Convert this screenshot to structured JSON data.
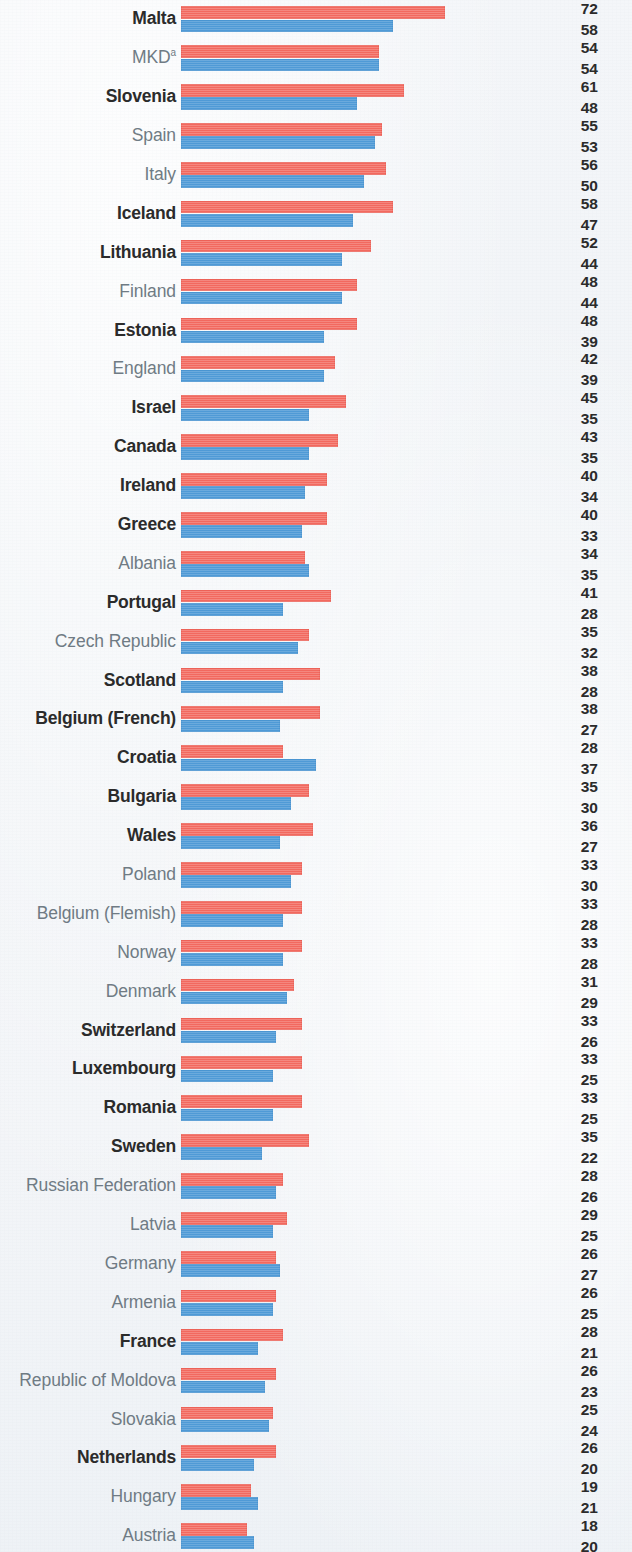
{
  "chart_data": {
    "type": "bar",
    "orientation": "horizontal",
    "title": "",
    "subtitle": "",
    "xlabel": "",
    "ylabel": "",
    "grid": false,
    "legend_position": "none",
    "xlim": [
      0,
      72
    ],
    "value_axis_max": 72,
    "colors": {
      "series_red": "#f2695f",
      "series_blue": "#4f9ad6",
      "background": "#f2f5f8",
      "label_regular": "#6f7b84",
      "label_bold": "#2b2b2b",
      "value_text": "#2b2b2b"
    },
    "series": [
      {
        "name": "red",
        "color": "#f2695f",
        "position": "top"
      },
      {
        "name": "blue",
        "color": "#4f9ad6",
        "position": "bottom"
      }
    ],
    "categories": [
      "Malta",
      "MKD",
      "Slovenia",
      "Spain",
      "Italy",
      "Iceland",
      "Lithuania",
      "Finland",
      "Estonia",
      "England",
      "Israel",
      "Canada",
      "Ireland",
      "Greece",
      "Albania",
      "Portugal",
      "Czech Republic",
      "Scotland",
      "Belgium (French)",
      "Croatia",
      "Bulgaria",
      "Wales",
      "Poland",
      "Belgium (Flemish)",
      "Norway",
      "Denmark",
      "Switzerland",
      "Luxembourg",
      "Romania",
      "Sweden",
      "Russian Federation",
      "Latvia",
      "Germany",
      "Armenia",
      "France",
      "Republic of Moldova",
      "Slovakia",
      "Netherlands",
      "Hungary",
      "Austria",
      "Ukraine"
    ],
    "values_red": [
      72,
      54,
      61,
      55,
      56,
      58,
      52,
      48,
      48,
      42,
      45,
      43,
      40,
      40,
      34,
      41,
      35,
      38,
      38,
      28,
      35,
      36,
      33,
      33,
      33,
      31,
      33,
      33,
      33,
      35,
      28,
      29,
      26,
      26,
      28,
      26,
      25,
      26,
      19,
      18,
      16
    ],
    "values_blue": [
      58,
      54,
      48,
      53,
      50,
      47,
      44,
      44,
      39,
      39,
      35,
      35,
      34,
      33,
      35,
      28,
      32,
      28,
      27,
      37,
      30,
      27,
      30,
      28,
      28,
      29,
      26,
      25,
      25,
      22,
      26,
      25,
      27,
      25,
      21,
      23,
      24,
      20,
      21,
      20,
      17
    ]
  },
  "rows": [
    {
      "label": "Malta",
      "superscript": "",
      "bold": true,
      "red": 72,
      "blue": 58
    },
    {
      "label": "MKD",
      "superscript": "a",
      "bold": false,
      "red": 54,
      "blue": 54
    },
    {
      "label": "Slovenia",
      "superscript": "",
      "bold": true,
      "red": 61,
      "blue": 48
    },
    {
      "label": "Spain",
      "superscript": "",
      "bold": false,
      "red": 55,
      "blue": 53
    },
    {
      "label": "Italy",
      "superscript": "",
      "bold": false,
      "red": 56,
      "blue": 50
    },
    {
      "label": "Iceland",
      "superscript": "",
      "bold": true,
      "red": 58,
      "blue": 47
    },
    {
      "label": "Lithuania",
      "superscript": "",
      "bold": true,
      "red": 52,
      "blue": 44
    },
    {
      "label": "Finland",
      "superscript": "",
      "bold": false,
      "red": 48,
      "blue": 44
    },
    {
      "label": "Estonia",
      "superscript": "",
      "bold": true,
      "red": 48,
      "blue": 39
    },
    {
      "label": "England",
      "superscript": "",
      "bold": false,
      "red": 42,
      "blue": 39
    },
    {
      "label": "Israel",
      "superscript": "",
      "bold": true,
      "red": 45,
      "blue": 35
    },
    {
      "label": "Canada",
      "superscript": "",
      "bold": true,
      "red": 43,
      "blue": 35
    },
    {
      "label": "Ireland",
      "superscript": "",
      "bold": true,
      "red": 40,
      "blue": 34
    },
    {
      "label": "Greece",
      "superscript": "",
      "bold": true,
      "red": 40,
      "blue": 33
    },
    {
      "label": "Albania",
      "superscript": "",
      "bold": false,
      "red": 34,
      "blue": 35
    },
    {
      "label": "Portugal",
      "superscript": "",
      "bold": true,
      "red": 41,
      "blue": 28
    },
    {
      "label": "Czech Republic",
      "superscript": "",
      "bold": false,
      "red": 35,
      "blue": 32
    },
    {
      "label": "Scotland",
      "superscript": "",
      "bold": true,
      "red": 38,
      "blue": 28
    },
    {
      "label": "Belgium (French)",
      "superscript": "",
      "bold": true,
      "red": 38,
      "blue": 27
    },
    {
      "label": "Croatia",
      "superscript": "",
      "bold": true,
      "red": 28,
      "blue": 37
    },
    {
      "label": "Bulgaria",
      "superscript": "",
      "bold": true,
      "red": 35,
      "blue": 30
    },
    {
      "label": "Wales",
      "superscript": "",
      "bold": true,
      "red": 36,
      "blue": 27
    },
    {
      "label": "Poland",
      "superscript": "",
      "bold": false,
      "red": 33,
      "blue": 30
    },
    {
      "label": "Belgium (Flemish)",
      "superscript": "",
      "bold": false,
      "red": 33,
      "blue": 28
    },
    {
      "label": "Norway",
      "superscript": "",
      "bold": false,
      "red": 33,
      "blue": 28
    },
    {
      "label": "Denmark",
      "superscript": "",
      "bold": false,
      "red": 31,
      "blue": 29
    },
    {
      "label": "Switzerland",
      "superscript": "",
      "bold": true,
      "red": 33,
      "blue": 26
    },
    {
      "label": "Luxembourg",
      "superscript": "",
      "bold": true,
      "red": 33,
      "blue": 25
    },
    {
      "label": "Romania",
      "superscript": "",
      "bold": true,
      "red": 33,
      "blue": 25
    },
    {
      "label": "Sweden",
      "superscript": "",
      "bold": true,
      "red": 35,
      "blue": 22
    },
    {
      "label": "Russian Federation",
      "superscript": "",
      "bold": false,
      "red": 28,
      "blue": 26
    },
    {
      "label": "Latvia",
      "superscript": "",
      "bold": false,
      "red": 29,
      "blue": 25
    },
    {
      "label": "Germany",
      "superscript": "",
      "bold": false,
      "red": 26,
      "blue": 27
    },
    {
      "label": "Armenia",
      "superscript": "",
      "bold": false,
      "red": 26,
      "blue": 25
    },
    {
      "label": "France",
      "superscript": "",
      "bold": true,
      "red": 28,
      "blue": 21
    },
    {
      "label": "Republic of Moldova",
      "superscript": "",
      "bold": false,
      "red": 26,
      "blue": 23
    },
    {
      "label": "Slovakia",
      "superscript": "",
      "bold": false,
      "red": 25,
      "blue": 24
    },
    {
      "label": "Netherlands",
      "superscript": "",
      "bold": true,
      "red": 26,
      "blue": 20
    },
    {
      "label": "Hungary",
      "superscript": "",
      "bold": false,
      "red": 19,
      "blue": 21
    },
    {
      "label": "Austria",
      "superscript": "",
      "bold": false,
      "red": 18,
      "blue": 20
    },
    {
      "label": "Ukraine",
      "superscript": "",
      "bold": false,
      "red": 16,
      "blue": 17
    }
  ],
  "layout": {
    "bar_origin_px": 181,
    "px_per_unit": 3.66,
    "row_pitch_px": 38.9
  }
}
